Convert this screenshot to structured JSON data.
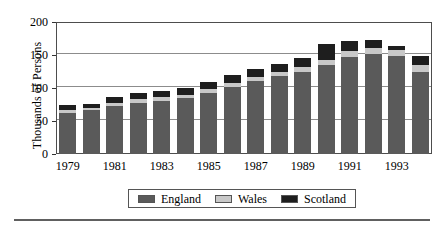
{
  "chart_data": {
    "type": "bar",
    "stacked": true,
    "title": "",
    "subtitle": "",
    "xlabel": "",
    "ylabel": "Thousands of Persons",
    "ylim": [
      0,
      200
    ],
    "yticks": [
      0,
      50,
      100,
      150,
      200
    ],
    "ytick_labels": [
      "0",
      "50",
      "100",
      "150",
      "200"
    ],
    "grid": true,
    "grid_axis": "y",
    "legend_position": "bottom",
    "categories": [
      "1979",
      "1980",
      "1981",
      "1982",
      "1983",
      "1984",
      "1985",
      "1986",
      "1987",
      "1988",
      "1989",
      "1990",
      "1991",
      "1992",
      "1993",
      "1994"
    ],
    "xtick_labels_shown": [
      "1979",
      "1981",
      "1983",
      "1985",
      "1987",
      "1989",
      "1991",
      "1993"
    ],
    "series": [
      {
        "name": "England",
        "color": "#5a5a5a",
        "values": [
          62,
          66,
          73,
          78,
          81,
          85,
          93,
          101,
          110,
          118,
          125,
          135,
          147,
          152,
          148,
          124
        ]
      },
      {
        "name": "Wales",
        "color": "#c8c8c8",
        "values": [
          4,
          4,
          4,
          5,
          5,
          5,
          5,
          6,
          6,
          6,
          7,
          8,
          9,
          9,
          10,
          11
        ]
      },
      {
        "name": "Scotland",
        "color": "#1e1e1e",
        "values": [
          8,
          6,
          9,
          10,
          10,
          10,
          11,
          13,
          13,
          12,
          13,
          24,
          16,
          12,
          5,
          13
        ]
      }
    ],
    "totals": [
      74,
      76,
      86,
      93,
      96,
      100,
      109,
      120,
      129,
      136,
      145,
      167,
      172,
      173,
      163,
      148
    ]
  },
  "legend": {
    "items": [
      {
        "label": "England",
        "color": "#5a5a5a"
      },
      {
        "label": "Wales",
        "color": "#c8c8c8"
      },
      {
        "label": "Scotland",
        "color": "#1e1e1e"
      }
    ]
  }
}
